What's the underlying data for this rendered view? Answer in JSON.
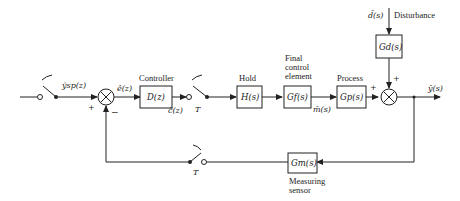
{
  "diagram": {
    "type": "sampled-data feedback control block diagram",
    "signals": {
      "setpoint": "ŷsp(z)",
      "error": "ê(z)",
      "controller_output": "ĉ(z)",
      "manipulated": "m̄(s)",
      "disturbance": "d̄(s)",
      "output": "ȳ(s)"
    },
    "blocks": {
      "controller": {
        "label": "Controller",
        "tf": "D(z)"
      },
      "hold": {
        "label": "Hold",
        "tf": "H(s)"
      },
      "final_control": {
        "label_lines": [
          "Final",
          "control",
          "element"
        ],
        "tf": "Gf(s)"
      },
      "process": {
        "label": "Process",
        "tf": "Gp(s)"
      },
      "disturbance": {
        "label": "Disturbance",
        "tf": "Gd(s)"
      },
      "sensor": {
        "label_lines": [
          "Measuring",
          "sensor"
        ],
        "tf": "Gm(s)"
      }
    },
    "samplers": {
      "period_label": "T"
    },
    "signs": {
      "plus": "+",
      "minus": "−"
    }
  }
}
